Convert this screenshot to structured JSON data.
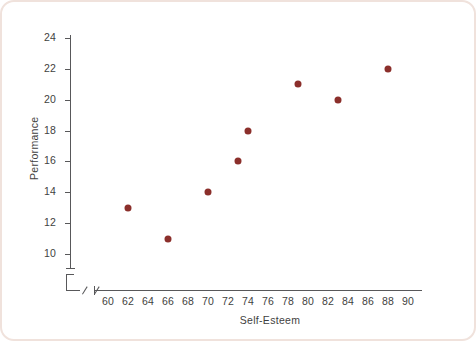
{
  "chart_data": {
    "type": "scatter",
    "title": "",
    "xlabel": "Self-Esteem",
    "ylabel": "Performance",
    "xlim": [
      60,
      90
    ],
    "ylim": [
      10,
      24
    ],
    "xticks": [
      60,
      62,
      64,
      66,
      68,
      70,
      72,
      74,
      76,
      78,
      80,
      82,
      84,
      86,
      88,
      90
    ],
    "yticks": [
      10,
      12,
      14,
      16,
      18,
      20,
      22,
      24
    ],
    "grid": false,
    "legend": null,
    "axis_break": true,
    "marker_color": "#8b2f2b",
    "points": [
      {
        "x": 62,
        "y": 13
      },
      {
        "x": 66,
        "y": 11
      },
      {
        "x": 70,
        "y": 14
      },
      {
        "x": 73,
        "y": 16
      },
      {
        "x": 74,
        "y": 18
      },
      {
        "x": 79,
        "y": 21
      },
      {
        "x": 83,
        "y": 20
      },
      {
        "x": 88,
        "y": 22
      }
    ]
  },
  "frame": {
    "border_color": "#f0e2dc",
    "background": "#ffffff"
  },
  "axes": {
    "line_color": "#58585a"
  }
}
